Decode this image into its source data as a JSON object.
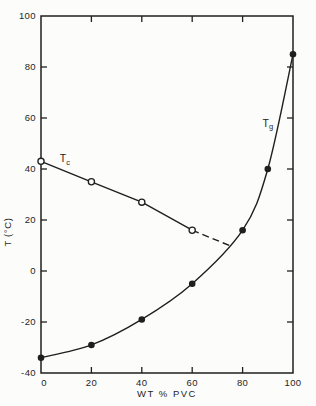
{
  "figure": {
    "background_color": "#fcfcfa",
    "ink_color": "#1f1f1f",
    "width": 316,
    "height": 406
  },
  "chart_data": {
    "type": "line",
    "title": "",
    "xlabel": "WT % PVC",
    "ylabel": "T (°C)",
    "xlim": [
      0,
      100
    ],
    "ylim": [
      -40,
      100
    ],
    "x_ticks": [
      0,
      20,
      40,
      60,
      80,
      100
    ],
    "y_ticks": [
      100,
      80,
      60,
      40,
      20,
      0,
      -20,
      -40
    ],
    "grid": false,
    "frame": "closed-box-with-inner-ticks-on-all-four-sides",
    "legend_position": "inline-annotations",
    "series": [
      {
        "name": "Tc",
        "annotation": {
          "main": "T",
          "sub": "c",
          "at_x": 9.5,
          "at_y": 44
        },
        "marker": "open-circle",
        "line_style": "solid-straight",
        "x": [
          0,
          20,
          40,
          60
        ],
        "values": [
          43,
          35,
          27,
          16
        ],
        "dashed_extension": {
          "to_x": 76,
          "to_y": 9.5
        }
      },
      {
        "name": "Tg",
        "annotation": {
          "main": "T",
          "sub": "g",
          "at_x": 90,
          "at_y": 58
        },
        "marker": "filled-circle",
        "line_style": "solid-smooth",
        "x": [
          0,
          20,
          40,
          60,
          80,
          90,
          100
        ],
        "values": [
          -34,
          -29,
          -19,
          -5,
          16,
          40,
          85
        ]
      }
    ]
  }
}
